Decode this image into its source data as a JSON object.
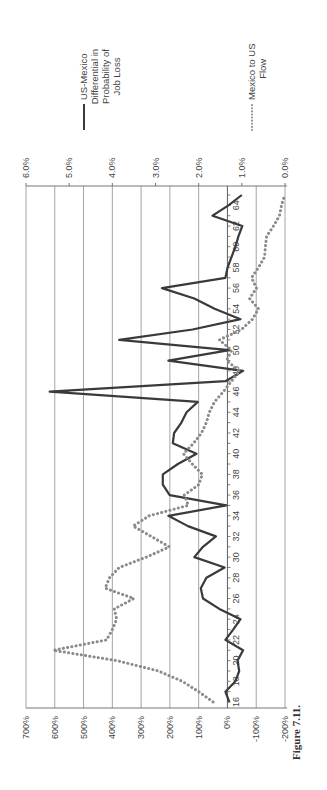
{
  "chart_data": {
    "type": "line",
    "orientation": "rotated 90 degrees counter-clockwise (page printed landscape)",
    "title": "",
    "caption": "Figure 7.11.",
    "xlabel": "",
    "x": [
      16,
      17,
      18,
      19,
      20,
      21,
      22,
      23,
      24,
      25,
      26,
      27,
      28,
      29,
      30,
      31,
      32,
      33,
      34,
      35,
      36,
      37,
      38,
      39,
      40,
      41,
      42,
      43,
      44,
      45,
      46,
      47,
      48,
      49,
      50,
      51,
      52,
      53,
      54,
      55,
      56,
      57,
      58,
      59,
      60,
      61,
      62,
      63,
      64,
      65
    ],
    "x_tick_labels": [
      "16",
      "18",
      "20",
      "22",
      "24",
      "26",
      "28",
      "30",
      "32",
      "34",
      "36",
      "38",
      "40",
      "42",
      "44",
      "46",
      "48",
      "50",
      "52",
      "54",
      "56",
      "58",
      "60",
      "62",
      "64"
    ],
    "left_axis": {
      "label": "",
      "ticks": [
        "700%",
        "600%",
        "500%",
        "400%",
        "300%",
        "200%",
        "100%",
        "0%",
        "-100%",
        "-200%"
      ],
      "range": [
        -200,
        700
      ]
    },
    "right_axis": {
      "label": "",
      "ticks": [
        "6.0%",
        "5.0%",
        "4.0%",
        "3.0%",
        "2.0%",
        "1.0%",
        "0.0%"
      ],
      "range": [
        0,
        6
      ]
    },
    "grid": true,
    "legend_position": "right",
    "series": [
      {
        "name": "US-Mexico Differential in Probability of Job Loss",
        "axis": "right",
        "style": "solid",
        "color": "#3a3a3a",
        "values": [
          1.29,
          1.38,
          1.15,
          1.06,
          1.1,
          0.97,
          1.38,
          1.2,
          1.03,
          1.52,
          1.9,
          1.95,
          1.82,
          1.4,
          2.1,
          1.9,
          1.6,
          2.25,
          2.7,
          1.36,
          2.67,
          2.83,
          2.83,
          2.48,
          2.05,
          2.6,
          2.57,
          2.4,
          2.28,
          2.02,
          5.45,
          1.38,
          0.97,
          2.7,
          1.29,
          3.84,
          2.14,
          1.03,
          1.63,
          2.1,
          2.85,
          1.38,
          1.33,
          1.24,
          1.15,
          1.08,
          0.99,
          1.68,
          1.31,
          1.0
        ]
      },
      {
        "name": "Mexico to US Flow",
        "axis": "left",
        "style": "dotted",
        "color": "#8a8a8a",
        "values": [
          50,
          100,
          157,
          240,
          385,
          605,
          420,
          400,
          385,
          393,
          325,
          425,
          410,
          376,
          282,
          202,
          265,
          328,
          272,
          136,
          150,
          100,
          87,
          122,
          153,
          118,
          90,
          73,
          63,
          45,
          14,
          -14,
          -42,
          3,
          -14,
          28,
          -49,
          -87,
          -108,
          -77,
          -101,
          -84,
          -108,
          -129,
          -132,
          -136,
          -160,
          -181,
          -188,
          -199
        ]
      }
    ]
  },
  "legend": {
    "items": [
      {
        "label_lines": [
          "US-Mexico",
          "Differential in",
          "Probability of",
          "Job Loss"
        ],
        "style": "solid"
      },
      {
        "label_lines": [
          "Mexico to US",
          "Flow"
        ],
        "style": "dotted"
      }
    ]
  },
  "caption": "Figure 7.11."
}
